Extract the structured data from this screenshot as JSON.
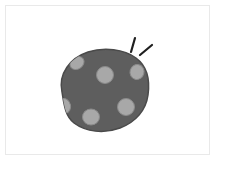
{
  "canvas": {
    "width": 228,
    "height": 170,
    "background_color": "#ffffff"
  },
  "frame": {
    "name": "image-frame",
    "x": 5,
    "y": 5,
    "width": 205,
    "height": 150,
    "border_color": "#e9e9e9",
    "fill_color": "#ffffff"
  },
  "illustration": {
    "title": "spotted-blob-with-sparkles",
    "style": "flat hand-drawn line art",
    "blob": {
      "name": "spotted-blob",
      "description": "rounded irregular blob resembling a cookie or rock",
      "fill_color": "#5e5e5e",
      "outline_color": "#4a4a4a",
      "outline_width": 1.5,
      "path": "M 62 92 C 58 74 70 58 88 52 C 104 47 124 49 136 58 C 147 66 150 80 148 95 C 146 110 136 122 120 128 C 104 134 86 132 74 123 C 65 116 64 104 62 92 Z",
      "bounds": {
        "x": 57,
        "y": 47,
        "width": 93,
        "height": 87
      }
    },
    "spots": [
      {
        "name": "spot-top-left",
        "cx": 77,
        "cy": 63,
        "rx": 7.5,
        "ry": 6,
        "rotation": -35,
        "fill_color": "#a8a8a8",
        "outline_color": "#8a8a8a"
      },
      {
        "name": "spot-center-top",
        "cx": 105,
        "cy": 75,
        "rx": 8.5,
        "ry": 8.5,
        "rotation": 0,
        "fill_color": "#a8a8a8",
        "outline_color": "#8a8a8a"
      },
      {
        "name": "spot-right-upper",
        "cx": 137,
        "cy": 72,
        "rx": 7,
        "ry": 7.5,
        "rotation": 15,
        "fill_color": "#a8a8a8",
        "outline_color": "#8a8a8a"
      },
      {
        "name": "spot-left-lower",
        "cx": 64,
        "cy": 106,
        "rx": 6.5,
        "ry": 7.5,
        "rotation": -15,
        "fill_color": "#a8a8a8",
        "outline_color": "#8a8a8a"
      },
      {
        "name": "spot-bottom-center",
        "cx": 91,
        "cy": 117,
        "rx": 8.5,
        "ry": 8,
        "rotation": 0,
        "fill_color": "#a8a8a8",
        "outline_color": "#8a8a8a"
      },
      {
        "name": "spot-right-lower",
        "cx": 126,
        "cy": 107,
        "rx": 8.5,
        "ry": 8.5,
        "rotation": 0,
        "fill_color": "#a8a8a8",
        "outline_color": "#8a8a8a"
      }
    ],
    "sparkles": {
      "name": "sparkle-strokes",
      "color": "#1f1f1f",
      "stroke_width": 2.2,
      "count": 2,
      "strokes": [
        {
          "name": "sparkle-stroke-vertical",
          "x1": 135,
          "y1": 38,
          "x2": 131,
          "y2": 52
        },
        {
          "name": "sparkle-stroke-diagonal",
          "x1": 152,
          "y1": 45,
          "x2": 140,
          "y2": 55
        }
      ]
    }
  }
}
